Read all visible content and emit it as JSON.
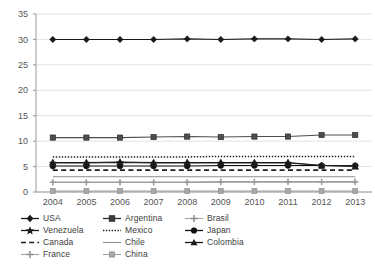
{
  "chart_data": {
    "type": "line",
    "title": "",
    "xlabel": "",
    "ylabel": "",
    "categories": [
      "2004",
      "2005",
      "2006",
      "2007",
      "2008",
      "2009",
      "2010",
      "2011",
      "2012",
      "2013"
    ],
    "ylim": [
      0,
      35
    ],
    "yticks": [
      0,
      5,
      10,
      15,
      20,
      25,
      30,
      35
    ],
    "grid": true,
    "legend_position": "bottom",
    "series": [
      {
        "name": "USA",
        "marker": "diamond",
        "line": "solid",
        "color": "#1a1a1a",
        "values": [
          30.0,
          30.0,
          30.0,
          30.0,
          30.1,
          30.0,
          30.1,
          30.1,
          30.0,
          30.1
        ]
      },
      {
        "name": "Argentina",
        "marker": "square",
        "line": "solid",
        "color": "#4d4d4d",
        "values": [
          10.7,
          10.7,
          10.7,
          10.8,
          10.9,
          10.8,
          10.9,
          10.9,
          11.2,
          11.2
        ]
      },
      {
        "name": "Brasil",
        "marker": "cross-light",
        "line": "solid",
        "color": "#9b9b9b",
        "values": [
          1.9,
          1.9,
          1.9,
          1.9,
          1.9,
          2.0,
          2.0,
          2.0,
          2.0,
          2.0
        ]
      },
      {
        "name": "Venezuela",
        "marker": "star",
        "line": "solid",
        "color": "#2b2b2b",
        "values": [
          5.7,
          5.7,
          5.8,
          5.7,
          5.7,
          5.7,
          5.7,
          5.7,
          5.2,
          5.1
        ]
      },
      {
        "name": "Mexico",
        "marker": "none",
        "line": "dotted",
        "color": "#1f1f1f",
        "values": [
          6.9,
          6.9,
          6.9,
          6.9,
          6.9,
          7.0,
          7.0,
          7.0,
          7.0,
          7.0
        ]
      },
      {
        "name": "Japan",
        "marker": "circle",
        "line": "solid",
        "color": "#111111",
        "values": [
          5.1,
          5.1,
          5.1,
          5.1,
          5.1,
          5.2,
          5.2,
          5.2,
          5.2,
          5.2
        ]
      },
      {
        "name": "Canada",
        "marker": "none",
        "line": "dashed",
        "color": "#1f1f1f",
        "values": [
          4.3,
          4.3,
          4.3,
          4.3,
          4.3,
          4.3,
          4.3,
          4.3,
          4.3,
          4.3
        ]
      },
      {
        "name": "Chile",
        "marker": "none",
        "line": "solid",
        "color": "#8e8e8e",
        "values": [
          3.0,
          3.0,
          3.0,
          3.0,
          3.0,
          3.0,
          3.0,
          3.0,
          3.0,
          3.0
        ]
      },
      {
        "name": "Colombia",
        "marker": "triangle",
        "line": "solid",
        "color": "#1a1a1a",
        "values": [
          5.8,
          5.8,
          5.9,
          5.8,
          5.8,
          5.8,
          5.8,
          5.8,
          5.2,
          5.0
        ]
      },
      {
        "name": "France",
        "marker": "cross-light",
        "line": "solid",
        "color": "#9b9b9b",
        "values": [
          1.9,
          1.9,
          1.9,
          1.9,
          1.9,
          2.0,
          2.0,
          2.0,
          2.0,
          2.0
        ]
      },
      {
        "name": "China",
        "marker": "square-light",
        "line": "solid",
        "color": "#9b9b9b",
        "values": [
          0.2,
          0.2,
          0.2,
          0.2,
          0.2,
          0.2,
          0.2,
          0.2,
          0.2,
          0.2
        ]
      }
    ]
  },
  "legend": {
    "rows": [
      [
        {
          "label": "USA",
          "key": "diamond-solid-key"
        },
        {
          "label": "Argentina",
          "key": "square-solid-key"
        },
        {
          "label": "Brasil",
          "key": "cross-light-key"
        }
      ],
      [
        {
          "label": "Venezuela",
          "key": "star-solid-key"
        },
        {
          "label": "Mexico",
          "key": "dotted-line-key"
        },
        {
          "label": "Japan",
          "key": "circle-solid-key"
        }
      ],
      [
        {
          "label": "Canada",
          "key": "dashed-line-key"
        },
        {
          "label": "Chile",
          "key": "thin-line-key"
        },
        {
          "label": "Colombia",
          "key": "triangle-solid-key"
        }
      ],
      [
        {
          "label": "France",
          "key": "cross-light-key"
        },
        {
          "label": "China",
          "key": "square-light-key"
        }
      ]
    ]
  }
}
